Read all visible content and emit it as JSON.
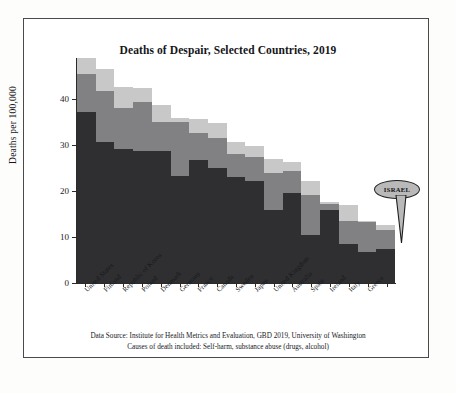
{
  "chart_data": {
    "type": "bar",
    "subtype": "stacked-bar",
    "title": "Deaths of Despair, Selected Countries, 2019",
    "xlabel": "",
    "ylabel": "Deaths per 100,000",
    "ylim": [
      0,
      49
    ],
    "yticks": [
      0,
      10,
      20,
      30,
      40
    ],
    "grid": false,
    "legend_position": "none",
    "categories": [
      "United States",
      "Finland",
      "Republic of Korea",
      "Poland",
      "Denmark",
      "Germany",
      "France",
      "Canada",
      "Sweden",
      "Japan",
      "United Kingdom",
      "Australia",
      "Spain",
      "Ireland",
      "Italy",
      "Greece",
      ""
    ],
    "series": [
      {
        "name": "segment-1",
        "color": "#2f2f31",
        "values": [
          37.3,
          30.7,
          29.2,
          28.8,
          28.7,
          23.4,
          26.7,
          25.1,
          23.1,
          22.2,
          15.8,
          19.6,
          10.5,
          16.0,
          8.4,
          6.8,
          7.3
        ]
      },
      {
        "name": "segment-2",
        "color": "#818183",
        "values": [
          8.3,
          11.1,
          9.0,
          10.6,
          6.4,
          11.6,
          6.0,
          6.4,
          5.1,
          5.3,
          8.1,
          4.8,
          8.6,
          1.3,
          5.1,
          6.4,
          4.2
        ]
      },
      {
        "name": "segment-3",
        "color": "#c8c8c9",
        "values": [
          3.4,
          4.7,
          4.6,
          3.1,
          3.6,
          1.0,
          3.1,
          3.4,
          2.6,
          2.3,
          3.1,
          2.0,
          3.1,
          0.4,
          3.4,
          0.3,
          1.1
        ]
      }
    ],
    "totals": [
      49.0,
      46.5,
      42.8,
      42.5,
      38.7,
      36.0,
      35.8,
      34.9,
      30.8,
      29.8,
      27.0,
      26.4,
      22.2,
      17.7,
      16.9,
      13.5,
      12.6
    ],
    "annotations": [
      {
        "label": "ISRAEL",
        "target_category_index": 16,
        "style": "speech-bubble"
      }
    ]
  },
  "notes": {
    "line1": "Data Source: Institute for Health Metrics and Evaluation, GBD 2019, University of Washington",
    "line2": "Causes of death included: Self-harm, substance abuse (drugs, alcohol)"
  },
  "colors": {
    "segment_dark": "#2f2f31",
    "segment_medium": "#818183",
    "segment_light": "#c8c8c9",
    "axis": "#2a2a2a",
    "callout_fill": "#b9b9ba",
    "callout_stroke": "#1f1f20",
    "page_background": "#ffffff"
  }
}
